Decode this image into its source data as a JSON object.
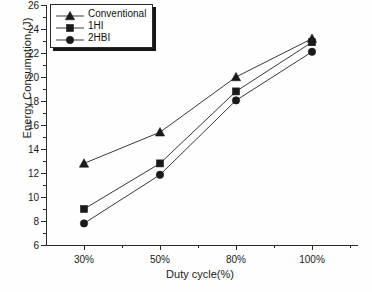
{
  "chart_data": {
    "type": "line",
    "title": "",
    "xlabel": "Duty cycle(%)",
    "ylabel": "Energy Consumption (J)",
    "categories": [
      "30%",
      "50%",
      "80%",
      "100%"
    ],
    "xtick_labels": [
      "30%",
      "50%",
      "80%",
      "100%"
    ],
    "ytick_labels": [
      "6",
      "8",
      "10",
      "12",
      "14",
      "16",
      "18",
      "20",
      "22",
      "24",
      "26"
    ],
    "ytick_values": [
      6,
      8,
      10,
      12,
      14,
      16,
      18,
      20,
      22,
      24,
      26
    ],
    "ylim": [
      6,
      26
    ],
    "grid": false,
    "legend_position": "top-left",
    "series": [
      {
        "name": "Conventional",
        "marker": "triangle",
        "color": "#1a1a1a",
        "values": [
          12.8,
          15.4,
          20.0,
          23.2
        ]
      },
      {
        "name": "1HI",
        "marker": "square",
        "color": "#1a1a1a",
        "values": [
          9.0,
          12.8,
          18.8,
          22.9
        ]
      },
      {
        "name": "2HBI",
        "marker": "circle",
        "color": "#1a1a1a",
        "values": [
          7.8,
          11.85,
          18.05,
          22.1
        ]
      }
    ]
  },
  "legend": {
    "entries": [
      {
        "label": "Conventional",
        "marker": "triangle-marker-icon"
      },
      {
        "label": "1HI",
        "marker": "square-marker-icon"
      },
      {
        "label": "2HBI",
        "marker": "circle-marker-icon"
      }
    ]
  },
  "colors": {
    "axis": "#2b2b2b",
    "line": "#3a3a3a",
    "marker": "#1a1a1a",
    "background": "#fefefe"
  }
}
